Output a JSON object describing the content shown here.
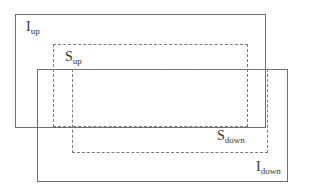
{
  "diagram": {
    "rectangles": [
      {
        "id": "I_up",
        "style": "solid",
        "label_main": "I",
        "label_sub": "up",
        "x": 15,
        "y": 14,
        "w": 250,
        "h": 113
      },
      {
        "id": "I_down",
        "style": "solid",
        "label_main": "I",
        "label_sub": "down",
        "x": 37,
        "y": 69,
        "w": 250,
        "h": 112
      },
      {
        "id": "S_up",
        "style": "dashed",
        "label_main": "S",
        "label_sub": "up",
        "x": 53,
        "y": 44,
        "w": 194,
        "h": 82
      },
      {
        "id": "S_down",
        "style": "dashed",
        "label_main": "S",
        "label_sub": "down",
        "x": 72,
        "y": 69,
        "w": 195,
        "h": 83
      }
    ],
    "labels": {
      "i_up": {
        "main": "I",
        "sub": "up"
      },
      "s_up": {
        "main": "S",
        "sub": "up"
      },
      "s_down": {
        "main": "S",
        "sub": "down"
      },
      "i_down": {
        "main": "I",
        "sub": "down"
      }
    },
    "colors": {
      "line": "#6e6e6e",
      "text": "#333333",
      "background": "#ffffff"
    }
  }
}
